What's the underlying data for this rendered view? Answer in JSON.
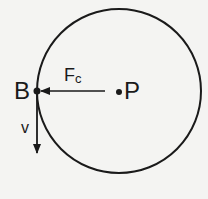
{
  "diagram": {
    "type": "circular-motion",
    "circle": {
      "center": [
        119,
        91
      ],
      "radius": 82,
      "stroke": "#1a1a1a"
    },
    "points": {
      "B": {
        "label": "B",
        "position": [
          37,
          91
        ]
      },
      "P": {
        "label": "P",
        "position": [
          119,
          91
        ]
      }
    },
    "vectors": {
      "centripetal_force": {
        "label_main": "F",
        "label_sub": "c",
        "from": [
          105,
          91
        ],
        "to": [
          40,
          91
        ]
      },
      "velocity": {
        "label": "v",
        "from": [
          37,
          91
        ],
        "to": [
          37,
          153
        ]
      }
    },
    "colors": {
      "ink": "#1a1a1a",
      "background": "#f4f4f2"
    }
  }
}
